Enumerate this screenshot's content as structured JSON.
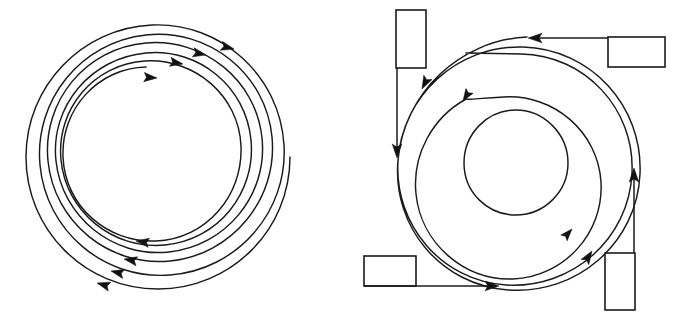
{
  "figure": {
    "background_color": "#ffffff",
    "stroke_color": "#1a1a1a",
    "arrow_fill_color": "#111111",
    "width": 675,
    "height": 315
  },
  "left_diagram": {
    "name": "clockwise-inward-spiral",
    "center": {
      "x": 158,
      "y": 157
    },
    "turns": 4.6,
    "direction": "clockwise",
    "radius_start": 132,
    "radius_end": 62,
    "arrow_count": 8,
    "top_arrow_count": 4,
    "bottom_arrow_count": 4,
    "arrowheads": [
      {
        "id": "top-outer-1",
        "x": 234,
        "y": 49,
        "angle": 14
      },
      {
        "id": "top-outer-2",
        "x": 206,
        "y": 55,
        "angle": 12
      },
      {
        "id": "top-mid-1",
        "x": 183,
        "y": 64,
        "angle": 10
      },
      {
        "id": "top-mid-2",
        "x": 155,
        "y": 77,
        "angle": 6
      },
      {
        "id": "bottom-inner-1",
        "x": 136,
        "y": 241,
        "angle": 188
      },
      {
        "id": "bottom-mid-1",
        "x": 124,
        "y": 259,
        "angle": 190
      },
      {
        "id": "bottom-mid-2",
        "x": 110,
        "y": 271,
        "angle": 193
      },
      {
        "id": "bottom-outer-1",
        "x": 96,
        "y": 283,
        "angle": 196
      }
    ]
  },
  "right_diagram": {
    "name": "counterclockwise-spiral-with-boxes",
    "center": {
      "x": 516,
      "y": 161
    },
    "turns": 2.55,
    "direction": "counterclockwise",
    "radius_start": 124,
    "radius_end": 52,
    "box_count": 4,
    "boxes": [
      {
        "id": "box-top-left",
        "x": 396,
        "y": 10,
        "width": 30,
        "height": 58,
        "orientation": "vertical"
      },
      {
        "id": "box-top-right",
        "x": 608,
        "y": 37,
        "width": 57,
        "height": 30,
        "orientation": "horizontal"
      },
      {
        "id": "box-bottom-left",
        "x": 364,
        "y": 256,
        "width": 52,
        "height": 30,
        "orientation": "horizontal"
      },
      {
        "id": "box-bottom-right",
        "x": 605,
        "y": 253,
        "width": 30,
        "height": 57,
        "orientation": "vertical"
      }
    ],
    "leads": [
      {
        "id": "lead-top-left",
        "from": "box-top-left",
        "direction": "down",
        "arrow_at": {
          "x": 396,
          "y": 150
        }
      },
      {
        "id": "lead-top-right",
        "from": "box-top-right",
        "direction": "left",
        "arrow_at": {
          "x": 527,
          "y": 37
        }
      },
      {
        "id": "lead-bottom-left",
        "from": "box-bottom-left",
        "direction": "right",
        "arrow_at": {
          "x": 497,
          "y": 286
        }
      },
      {
        "id": "lead-bottom-right",
        "from": "box-bottom-right",
        "direction": "up",
        "arrow_at": {
          "x": 635,
          "y": 168
        }
      }
    ],
    "arrowheads": [
      {
        "id": "spiral-upper-left-outer",
        "x": 432,
        "y": 79,
        "angle": 125
      },
      {
        "id": "spiral-upper-left-inner",
        "x": 468,
        "y": 95,
        "angle": 118
      },
      {
        "id": "spiral-lower-right-inner",
        "x": 570,
        "y": 227,
        "angle": 310
      },
      {
        "id": "spiral-lower-right-outer",
        "x": 591,
        "y": 250,
        "angle": 302
      }
    ]
  }
}
